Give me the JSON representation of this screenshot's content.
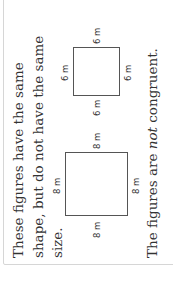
{
  "panel": {
    "line1": "These figures have the same",
    "line2": "shape, but do not have the same",
    "line3": "size.",
    "conclusion_prefix": "The figures are ",
    "conclusion_emph": "not",
    "conclusion_suffix": " congruent."
  },
  "figures": {
    "large_square": {
      "top": "8 m",
      "left": "8 m",
      "right": "8 m",
      "bottom": "8 m"
    },
    "small_square": {
      "top": "6 m",
      "left": "6 m",
      "right": "6 m",
      "bottom": "6 m"
    }
  }
}
